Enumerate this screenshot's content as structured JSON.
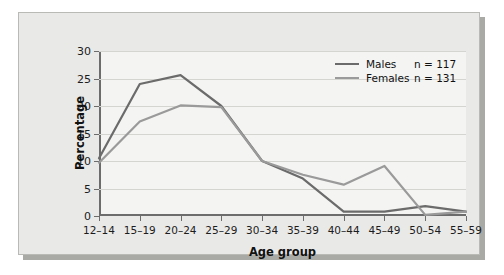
{
  "chart_data": {
    "type": "line",
    "title": "",
    "xlabel": "Age group",
    "ylabel": "Percentage",
    "categories": [
      "12–14",
      "15–19",
      "20–24",
      "25–29",
      "30–34",
      "35–39",
      "40–44",
      "45–49",
      "50–54",
      "55–59"
    ],
    "ylim": [
      0,
      30
    ],
    "yticks": [
      0,
      5,
      10,
      15,
      20,
      25,
      30
    ],
    "ytick_labels": [
      "0",
      "5",
      "10",
      "15",
      "20",
      "25",
      "30"
    ],
    "grid": true,
    "legend_position": "top-right",
    "series": [
      {
        "name": "Males",
        "n_label": "n = 117",
        "n": 117,
        "color": "#6b6b6b",
        "values": [
          10.5,
          24.0,
          25.6,
          20.0,
          10.0,
          6.8,
          0.8,
          0.8,
          1.8,
          0.8
        ]
      },
      {
        "name": "Females",
        "n_label": "n = 131",
        "n": 131,
        "color": "#9a9a9a",
        "values": [
          9.7,
          17.2,
          20.1,
          19.8,
          10.0,
          7.5,
          5.7,
          9.1,
          0.2,
          0.8
        ]
      }
    ]
  },
  "axes": {
    "x_title": "Age group",
    "y_title": "Percentage"
  },
  "legend": {
    "entries": [
      {
        "label": "Males",
        "count": "n = 117"
      },
      {
        "label": "Females",
        "count": "n = 131"
      }
    ]
  },
  "colors": {
    "males_line": "#6b6b6b",
    "females_line": "#9a9a9a",
    "axis": "#6c6c6c",
    "grid": "#d4d4d1",
    "card_background": "#e9e9e7",
    "plot_background": "#f4f4f2",
    "card_border": "#b9b9b6"
  }
}
